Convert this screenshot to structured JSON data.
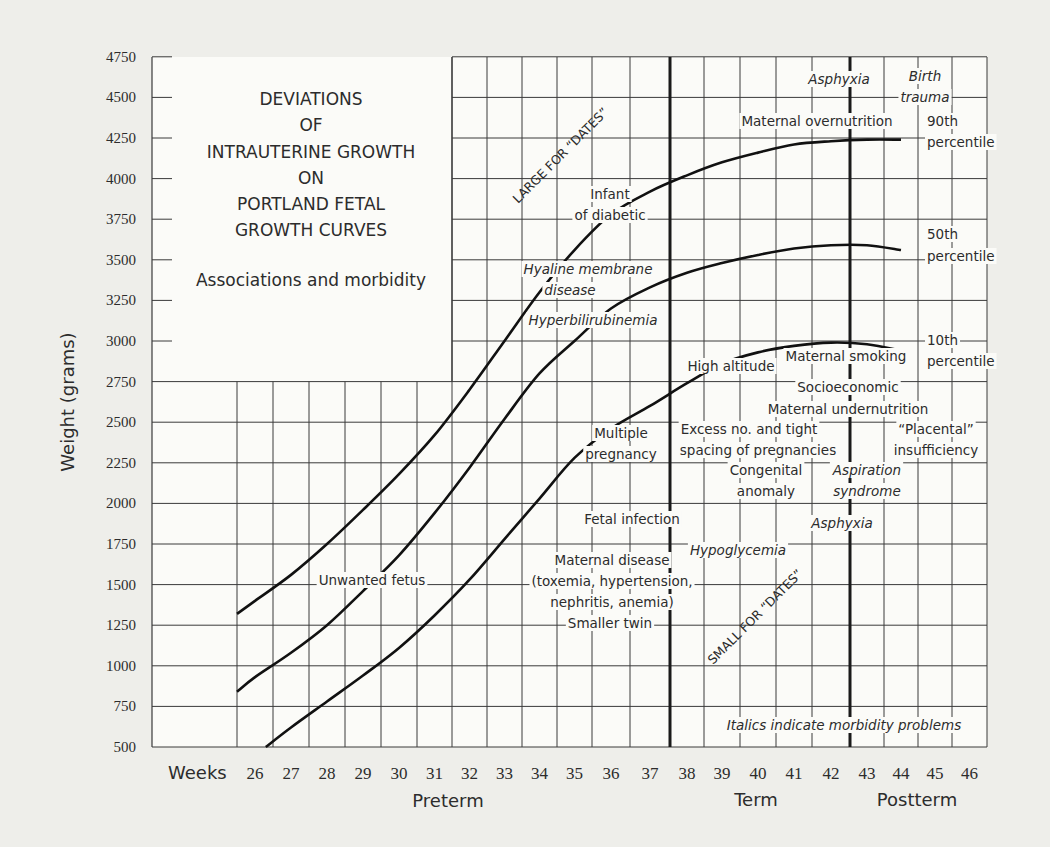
{
  "chart_data": {
    "type": "line",
    "title": [
      "DEVIATIONS",
      "OF",
      "INTRAUTERINE GROWTH",
      "ON",
      "PORTLAND FETAL",
      "GROWTH CURVES"
    ],
    "subtitle": "Associations and morbidity",
    "xlabel": "Weeks",
    "ylabel": "Weight (grams)",
    "x_ticks": [
      26,
      27,
      28,
      29,
      30,
      31,
      32,
      33,
      34,
      35,
      36,
      37,
      38,
      39,
      40,
      41,
      42,
      43,
      44,
      45,
      46
    ],
    "y_ticks": [
      4750,
      4500,
      4250,
      4000,
      3750,
      3500,
      3250,
      3000,
      2750,
      2500,
      2250,
      2000,
      1750,
      1500,
      1250,
      1000,
      750,
      500
    ],
    "ylim": [
      500,
      4750
    ],
    "xlim": [
      25,
      46
    ],
    "periods": [
      {
        "label": "Preterm",
        "range": [
          25,
          37.5
        ]
      },
      {
        "label": "Term",
        "range": [
          37.5,
          42.5
        ]
      },
      {
        "label": "Postterm",
        "range": [
          42.5,
          46
        ]
      }
    ],
    "grid": true,
    "series": [
      {
        "name": "90th percentile",
        "x": [
          25.5,
          26,
          27,
          28,
          29,
          30,
          31,
          32,
          33,
          34,
          35,
          36,
          37,
          38,
          39,
          40,
          41,
          42,
          43,
          44
        ],
        "values": [
          1320,
          1400,
          1560,
          1750,
          1960,
          2180,
          2420,
          2700,
          3000,
          3300,
          3560,
          3780,
          3920,
          4020,
          4100,
          4160,
          4210,
          4230,
          4240,
          4240
        ]
      },
      {
        "name": "50th percentile",
        "x": [
          25.5,
          26,
          27,
          28,
          29,
          30,
          31,
          32,
          33,
          34,
          35,
          36,
          37,
          38,
          39,
          40,
          41,
          42,
          43,
          44
        ],
        "values": [
          840,
          930,
          1080,
          1250,
          1460,
          1680,
          1940,
          2220,
          2520,
          2800,
          3000,
          3200,
          3330,
          3420,
          3480,
          3530,
          3570,
          3590,
          3590,
          3560
        ]
      },
      {
        "name": "10th percentile",
        "x": [
          26.3,
          27,
          28,
          29,
          30,
          31,
          32,
          33,
          34,
          35,
          36,
          37,
          38,
          39,
          40,
          41,
          42,
          43,
          44
        ],
        "values": [
          500,
          620,
          780,
          940,
          1110,
          1310,
          1530,
          1780,
          2030,
          2280,
          2460,
          2600,
          2740,
          2860,
          2930,
          2970,
          2990,
          2980,
          2940
        ]
      }
    ],
    "series_labels": [
      {
        "text": [
          "90th",
          "percentile"
        ],
        "x": 44.2,
        "y": 4250
      },
      {
        "text": [
          "50th",
          "percentile"
        ],
        "x": 44.2,
        "y": 3560
      },
      {
        "text": [
          "10th",
          "percentile"
        ],
        "x": 44.2,
        "y": 2960
      }
    ],
    "region_labels": [
      {
        "text": "LARGE FOR “DATES”",
        "rotated": -45
      },
      {
        "text": "SMALL FOR “DATES”",
        "rotated": -45
      }
    ],
    "annotations": [
      {
        "text": "Infant",
        "italic": false
      },
      {
        "text": "of diabetic",
        "italic": false
      },
      {
        "text": "Hyaline membrane",
        "italic": true
      },
      {
        "text": "disease",
        "italic": true
      },
      {
        "text": "Hyperbilirubinemia",
        "italic": true
      },
      {
        "text": "Asphyxia",
        "italic": true
      },
      {
        "text": "Birth",
        "italic": true
      },
      {
        "text": "trauma",
        "italic": true
      },
      {
        "text": "Maternal overnutrition",
        "italic": false
      },
      {
        "text": "High altitude",
        "italic": false
      },
      {
        "text": "Maternal smoking",
        "italic": false
      },
      {
        "text": "Socioeconomic",
        "italic": false
      },
      {
        "text": "Maternal undernutrition",
        "italic": false
      },
      {
        "text": "Multiple",
        "italic": false
      },
      {
        "text": "pregnancy",
        "italic": false
      },
      {
        "text": "Excess no. and tight",
        "italic": false
      },
      {
        "text": "spacing of pregnancies",
        "italic": false
      },
      {
        "text": "“Placental”",
        "italic": false
      },
      {
        "text": "insufficiency",
        "italic": false
      },
      {
        "text": "Congenital",
        "italic": false
      },
      {
        "text": "anomaly",
        "italic": false
      },
      {
        "text": "Aspiration",
        "italic": true
      },
      {
        "text": "syndrome",
        "italic": true
      },
      {
        "text": "Fetal infection",
        "italic": false
      },
      {
        "text": "Asphyxia",
        "italic": true
      },
      {
        "text": "Maternal disease",
        "italic": false
      },
      {
        "text": "(toxemia, hypertension,",
        "italic": false
      },
      {
        "text": "nephritis, anemia)",
        "italic": false
      },
      {
        "text": "Hypoglycemia",
        "italic": true
      },
      {
        "text": "Smaller twin",
        "italic": false
      },
      {
        "text": "Unwanted fetus",
        "italic": false
      },
      {
        "text": "Italics indicate morbidity problems",
        "italic": true
      }
    ],
    "legend": null
  }
}
